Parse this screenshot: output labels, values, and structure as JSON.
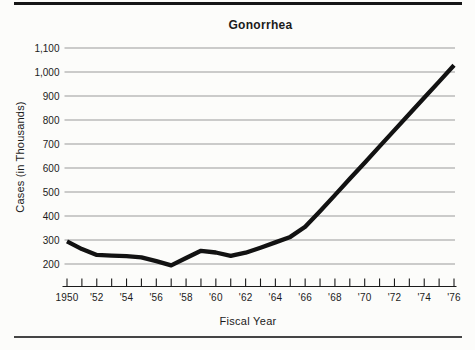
{
  "chart_data": {
    "type": "line",
    "title": "Gonorrhea",
    "xlabel": "Fiscal Year",
    "ylabel": "Cases (in Thousands)",
    "x": [
      1950,
      1951,
      1952,
      1953,
      1954,
      1955,
      1956,
      1957,
      1958,
      1959,
      1960,
      1961,
      1962,
      1963,
      1964,
      1965,
      1966,
      1967,
      1968,
      1969,
      1970,
      1971,
      1972,
      1973,
      1974,
      1975,
      1976
    ],
    "series": [
      {
        "name": "Gonorrhea cases (thousands)",
        "values": [
          294,
          262,
          238,
          235,
          233,
          228,
          212,
          194,
          225,
          255,
          248,
          234,
          247,
          268,
          290,
          313,
          355,
          420,
          487,
          555,
          622,
          690,
          758,
          825,
          893,
          960,
          1028
        ]
      }
    ],
    "xlim": [
      1950,
      1976
    ],
    "ylim": [
      200,
      1100
    ],
    "grid": "horizontal",
    "legend": "none",
    "x_ticks_every_year": true,
    "y_ticks": [
      {
        "value": 1100,
        "label": "1,100"
      },
      {
        "value": 1000,
        "label": "1,000"
      },
      {
        "value": 900,
        "label": "900"
      },
      {
        "value": 800,
        "label": "800"
      },
      {
        "value": 700,
        "label": "700"
      },
      {
        "value": 600,
        "label": "600"
      },
      {
        "value": 500,
        "label": "500"
      },
      {
        "value": 400,
        "label": "400"
      },
      {
        "value": 300,
        "label": "300"
      },
      {
        "value": 200,
        "label": "200"
      }
    ],
    "x_tick_labels": [
      {
        "year": 1950,
        "label": "1950"
      },
      {
        "year": 1952,
        "label": "'52"
      },
      {
        "year": 1954,
        "label": "'54"
      },
      {
        "year": 1956,
        "label": "'56"
      },
      {
        "year": 1958,
        "label": "'58"
      },
      {
        "year": 1960,
        "label": "'60"
      },
      {
        "year": 1962,
        "label": "'62"
      },
      {
        "year": 1964,
        "label": "'64"
      },
      {
        "year": 1966,
        "label": "'66"
      },
      {
        "year": 1968,
        "label": "'68"
      },
      {
        "year": 1970,
        "label": "'70"
      },
      {
        "year": 1972,
        "label": "'72"
      },
      {
        "year": 1974,
        "label": "'74"
      },
      {
        "year": 1976,
        "label": "'76"
      }
    ],
    "colors": {
      "line": "#121212",
      "grid": "#9a9a9a",
      "text": "#1b1b1b",
      "background": "#fcfcfa",
      "rule": "#161616"
    }
  }
}
